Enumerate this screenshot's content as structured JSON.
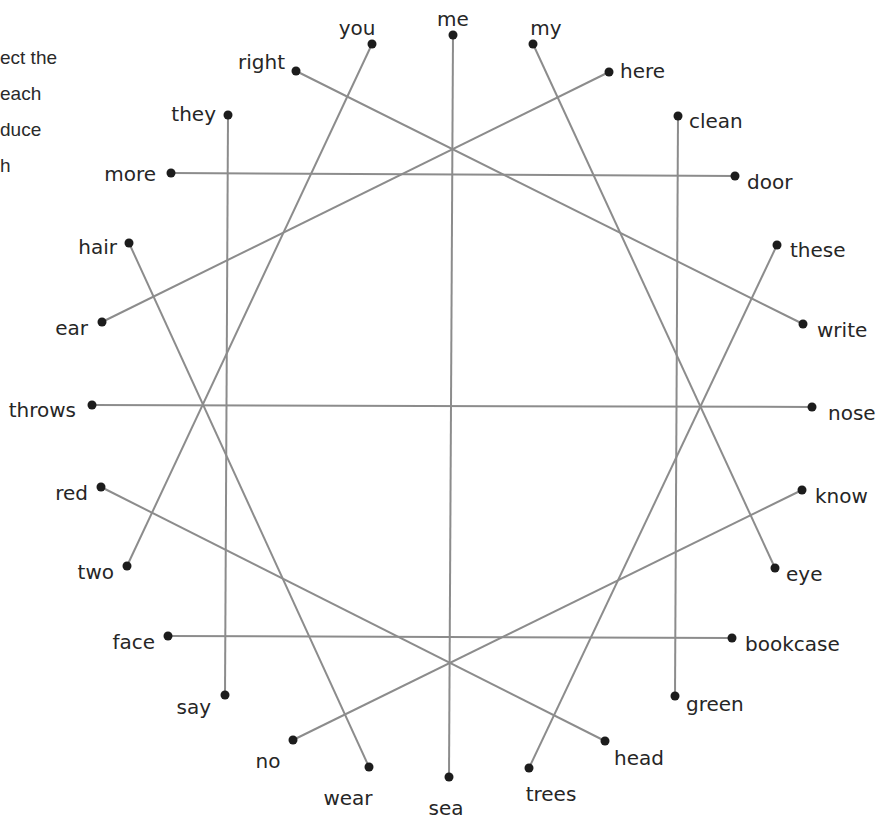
{
  "instructions": {
    "lines": [
      "ect the",
      " each",
      "duce",
      "h"
    ]
  },
  "diagram": {
    "line_color": "#8c8c8c",
    "dot_color": "#1c1c1c",
    "words": [
      {
        "id": "me",
        "label": "me",
        "x": 453,
        "y": 35,
        "lx": 453,
        "ly": 20,
        "anchor": "middle"
      },
      {
        "id": "you",
        "label": "you",
        "x": 372,
        "y": 44,
        "lx": 357,
        "ly": 29,
        "anchor": "middle"
      },
      {
        "id": "my",
        "label": "my",
        "x": 533,
        "y": 44,
        "lx": 546,
        "ly": 29,
        "anchor": "middle"
      },
      {
        "id": "right",
        "label": "right",
        "x": 296,
        "y": 71,
        "lx": 285,
        "ly": 63,
        "anchor": "end"
      },
      {
        "id": "here",
        "label": "here",
        "x": 609,
        "y": 72,
        "lx": 620,
        "ly": 72,
        "anchor": "start"
      },
      {
        "id": "they",
        "label": "they",
        "x": 228,
        "y": 115,
        "lx": 216,
        "ly": 115,
        "anchor": "end"
      },
      {
        "id": "clean",
        "label": "clean",
        "x": 678,
        "y": 116,
        "lx": 689,
        "ly": 122,
        "anchor": "start"
      },
      {
        "id": "more",
        "label": "more",
        "x": 171,
        "y": 173,
        "lx": 156,
        "ly": 175,
        "anchor": "end"
      },
      {
        "id": "door",
        "label": "door",
        "x": 735,
        "y": 176,
        "lx": 747,
        "ly": 183,
        "anchor": "start"
      },
      {
        "id": "hair",
        "label": "hair",
        "x": 129,
        "y": 243,
        "lx": 117,
        "ly": 248,
        "anchor": "end"
      },
      {
        "id": "these",
        "label": "these",
        "x": 777,
        "y": 245,
        "lx": 790,
        "ly": 251,
        "anchor": "start"
      },
      {
        "id": "ear",
        "label": "ear",
        "x": 102,
        "y": 322,
        "lx": 88,
        "ly": 329,
        "anchor": "end"
      },
      {
        "id": "write",
        "label": "write",
        "x": 803,
        "y": 324,
        "lx": 817,
        "ly": 331,
        "anchor": "start"
      },
      {
        "id": "throws",
        "label": "throws",
        "x": 92,
        "y": 405,
        "lx": 76,
        "ly": 411,
        "anchor": "end"
      },
      {
        "id": "nose",
        "label": "nose",
        "x": 812,
        "y": 407,
        "lx": 828,
        "ly": 414,
        "anchor": "start"
      },
      {
        "id": "red",
        "label": "red",
        "x": 101,
        "y": 487,
        "lx": 88,
        "ly": 494,
        "anchor": "end"
      },
      {
        "id": "know",
        "label": "know",
        "x": 802,
        "y": 490,
        "lx": 815,
        "ly": 497,
        "anchor": "start"
      },
      {
        "id": "two",
        "label": "two",
        "x": 127,
        "y": 566,
        "lx": 114,
        "ly": 573,
        "anchor": "end"
      },
      {
        "id": "eye",
        "label": "eye",
        "x": 775,
        "y": 568,
        "lx": 786,
        "ly": 575,
        "anchor": "start"
      },
      {
        "id": "face",
        "label": "face",
        "x": 168,
        "y": 636,
        "lx": 155,
        "ly": 643,
        "anchor": "end"
      },
      {
        "id": "bookcase",
        "label": "bookcase",
        "x": 732,
        "y": 638,
        "lx": 745,
        "ly": 645,
        "anchor": "start"
      },
      {
        "id": "say",
        "label": "say",
        "x": 225,
        "y": 695,
        "lx": 211,
        "ly": 708,
        "anchor": "end"
      },
      {
        "id": "green",
        "label": "green",
        "x": 675,
        "y": 696,
        "lx": 686,
        "ly": 705,
        "anchor": "start"
      },
      {
        "id": "no",
        "label": "no",
        "x": 293,
        "y": 740,
        "lx": 268,
        "ly": 762,
        "anchor": "middle"
      },
      {
        "id": "head",
        "label": "head",
        "x": 605,
        "y": 741,
        "lx": 614,
        "ly": 759,
        "anchor": "start"
      },
      {
        "id": "wear",
        "label": "wear",
        "x": 369,
        "y": 767,
        "lx": 348,
        "ly": 799,
        "anchor": "middle"
      },
      {
        "id": "trees",
        "label": "trees",
        "x": 529,
        "y": 768,
        "lx": 551,
        "ly": 795,
        "anchor": "middle"
      },
      {
        "id": "sea",
        "label": "sea",
        "x": 449,
        "y": 777,
        "lx": 446,
        "ly": 809,
        "anchor": "middle"
      }
    ],
    "connections": [
      [
        "me",
        "sea"
      ],
      [
        "you",
        "two"
      ],
      [
        "my",
        "eye"
      ],
      [
        "right",
        "write"
      ],
      [
        "here",
        "ear"
      ],
      [
        "they",
        "say"
      ],
      [
        "clean",
        "green"
      ],
      [
        "more",
        "door"
      ],
      [
        "hair",
        "wear"
      ],
      [
        "these",
        "trees"
      ],
      [
        "throws",
        "nose"
      ],
      [
        "red",
        "head"
      ],
      [
        "know",
        "no"
      ],
      [
        "face",
        "bookcase"
      ]
    ]
  }
}
